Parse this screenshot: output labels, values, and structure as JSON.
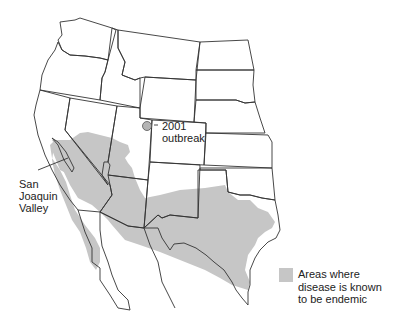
{
  "map": {
    "region": "Western United States and northern Mexico",
    "endemic_color": "#c6c6c6",
    "border_color": "#333333",
    "marker_color": "#b4b4b4"
  },
  "labels": {
    "outbreak_line1": "2001",
    "outbreak_line2": "outbreak",
    "valley_line1": "San",
    "valley_line2": "Joaquin",
    "valley_line3": "Valley"
  },
  "legend": {
    "text": "Areas where disease is known to be endemic"
  }
}
